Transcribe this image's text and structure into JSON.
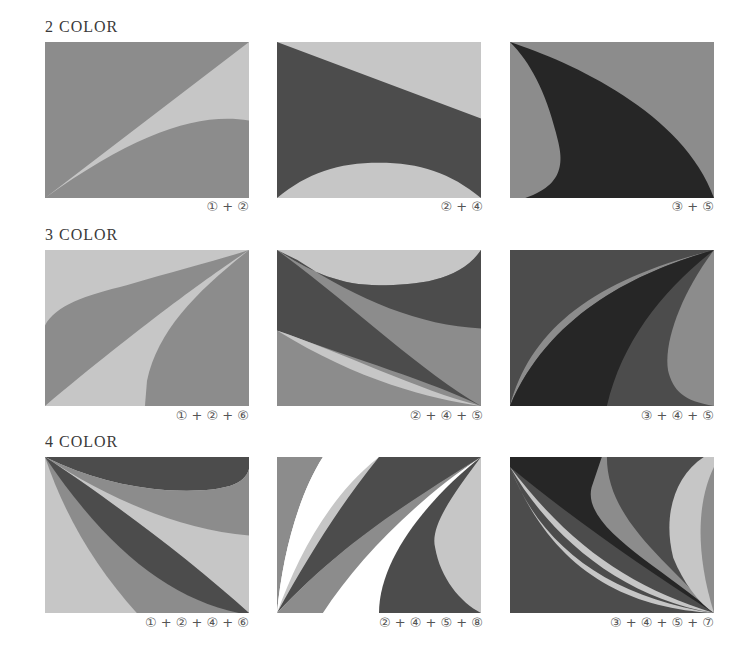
{
  "sections": [
    {
      "title": "2 COLOR",
      "panels": [
        {
          "caption": "① + ②"
        },
        {
          "caption": "② + ④"
        },
        {
          "caption": "③ + ⑤"
        }
      ]
    },
    {
      "title": "3 COLOR",
      "panels": [
        {
          "caption": "① + ② + ⑥"
        },
        {
          "caption": "② + ④ + ⑤"
        },
        {
          "caption": "③ + ④ + ⑤"
        }
      ]
    },
    {
      "title": "4 COLOR",
      "panels": [
        {
          "caption": "① + ② + ④ + ⑥"
        },
        {
          "caption": "② + ④ + ⑤ + ⑧"
        },
        {
          "caption": "③ + ④ + ⑤ + ⑦"
        }
      ]
    }
  ],
  "palette": {
    "light": "#c6c6c6",
    "medium": "#8c8c8c",
    "mid_dark": "#6b6b6b",
    "dark": "#4c4c4c",
    "very_dark": "#262626",
    "white": "#ffffff"
  }
}
